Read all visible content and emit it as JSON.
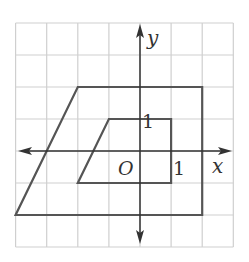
{
  "diagram": {
    "type": "coordinate-grid-dilation",
    "grid": {
      "x_min": -4,
      "x_max": 3,
      "y_min": -3,
      "y_max": 4,
      "color": "#cccccc"
    },
    "axes": {
      "x_label": "x",
      "y_label": "y",
      "origin_label": "O",
      "x_tick_label": "1",
      "y_tick_label": "1",
      "color": "#333333"
    },
    "shapes": [
      {
        "name": "small-parallelogram",
        "vertices": [
          [
            -1,
            1
          ],
          [
            1,
            1
          ],
          [
            1,
            -1
          ],
          [
            -2,
            -1
          ]
        ],
        "color": "#555555"
      },
      {
        "name": "large-parallelogram",
        "vertices": [
          [
            -2,
            2
          ],
          [
            2,
            2
          ],
          [
            2,
            -2
          ],
          [
            -4,
            -2
          ]
        ],
        "color": "#555555"
      }
    ]
  }
}
